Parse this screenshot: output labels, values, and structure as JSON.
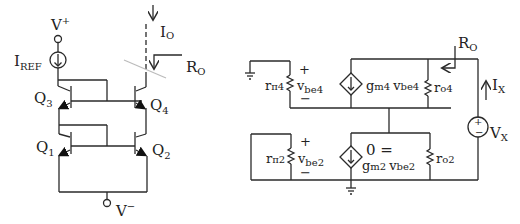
{
  "left_circuit": {
    "vplus": "V",
    "vplus_sup": "+",
    "vminus": "V",
    "vminus_sup": "−",
    "iref": "I",
    "iref_sub": "REF",
    "io": "I",
    "io_sub": "O",
    "ro": "R",
    "ro_sub": "O",
    "q1": "Q",
    "q1_sub": "1",
    "q2": "Q",
    "q2_sub": "2",
    "q3": "Q",
    "q3_sub": "3",
    "q4": "Q",
    "q4_sub": "4"
  },
  "right_circuit": {
    "rpi4": "r",
    "rpi4_sub": "π4",
    "vbe4": "v",
    "vbe4_sub": "be4",
    "gm4": "g",
    "gm4_sub": "m4",
    "gm4_v": "v",
    "gm4_v_sub": "be4",
    "ro4": "r",
    "ro4_sub": "o4",
    "ro": "R",
    "ro_sub": "O",
    "ix": "I",
    "ix_sub": "X",
    "vx": "V",
    "vx_sub": "X",
    "rpi2": "r",
    "rpi2_sub": "π2",
    "vbe2": "v",
    "vbe2_sub": "be2",
    "zero_eq": "0 =",
    "gm2": "g",
    "gm2_sub": "m2",
    "gm2_v": "v",
    "gm2_v_sub": "be2",
    "ro2": "r",
    "ro2_sub": "o2",
    "plus": "+",
    "minus": "−"
  }
}
